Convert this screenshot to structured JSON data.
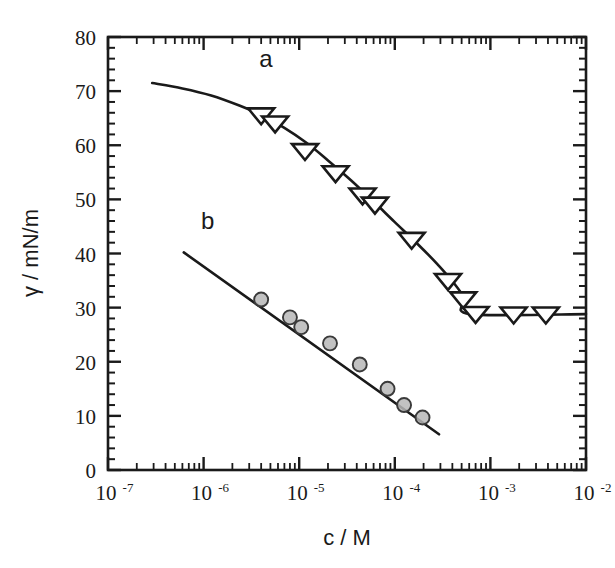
{
  "chart_data": {
    "type": "line",
    "title": "",
    "xlabel": "c / M",
    "ylabel": "γ / mN/m",
    "xscale": "log",
    "yscale": "linear",
    "xlim": [
      1e-07,
      0.01
    ],
    "ylim": [
      0,
      80
    ],
    "grid": false,
    "legend_position": "inline-annotation",
    "x_tick_labels": [
      "10-7",
      "10-6",
      "10-5",
      "10-4",
      "10-3",
      "10-2"
    ],
    "x_tick_mantissa": "10",
    "x_tick_exponents": [
      "-7",
      "-6",
      "-5",
      "-4",
      "-3",
      "-2"
    ],
    "x_tick_values": [
      1e-07,
      1e-06,
      1e-05,
      0.0001,
      0.001,
      0.01
    ],
    "y_tick_labels": [
      "0",
      "10",
      "20",
      "30",
      "40",
      "50",
      "60",
      "70",
      "80"
    ],
    "y_tick_values": [
      0,
      10,
      20,
      30,
      40,
      50,
      60,
      70,
      80
    ],
    "y_minor_step": 2,
    "annotations": [
      {
        "text": "a",
        "x": 4.5e-06,
        "y": 74.5
      },
      {
        "text": "b",
        "x": 1.1e-06,
        "y": 44.5
      }
    ],
    "series": [
      {
        "name": "a",
        "label": "a",
        "marker": "triangle-down",
        "marker_fill": "#ffffff",
        "marker_edge": "#1a1a1a",
        "marker_size": 13,
        "line_color": "#1a1a1a",
        "cmc": 0.00062,
        "plateau_value": 28.8,
        "points": [
          {
            "x": 4e-06,
            "y": 65.6
          },
          {
            "x": 5.6e-06,
            "y": 64.1
          },
          {
            "x": 1.15e-05,
            "y": 59.0
          },
          {
            "x": 2.4e-05,
            "y": 54.9
          },
          {
            "x": 4.6e-05,
            "y": 50.8
          },
          {
            "x": 6.2e-05,
            "y": 49.1
          },
          {
            "x": 0.00015,
            "y": 42.6
          },
          {
            "x": 0.00036,
            "y": 35.0
          },
          {
            "x": 0.00052,
            "y": 31.6
          },
          {
            "x": 0.0007,
            "y": 28.9
          },
          {
            "x": 0.00175,
            "y": 28.8
          },
          {
            "x": 0.0038,
            "y": 28.8
          }
        ],
        "curve": [
          {
            "x": 2.9e-07,
            "y": 71.5
          },
          {
            "x": 6e-07,
            "y": 70.5
          },
          {
            "x": 1.2e-06,
            "y": 69.2
          },
          {
            "x": 2.4e-06,
            "y": 67.3
          },
          {
            "x": 4e-06,
            "y": 65.6
          },
          {
            "x": 7e-06,
            "y": 63.2
          },
          {
            "x": 1.2e-05,
            "y": 60.4
          },
          {
            "x": 2e-05,
            "y": 57.2
          },
          {
            "x": 3.5e-05,
            "y": 53.5
          },
          {
            "x": 6e-05,
            "y": 49.6
          },
          {
            "x": 0.0001,
            "y": 45.8
          },
          {
            "x": 0.00017,
            "y": 41.9
          },
          {
            "x": 0.00028,
            "y": 38.0
          },
          {
            "x": 0.00042,
            "y": 34.4
          },
          {
            "x": 0.00054,
            "y": 31.6
          },
          {
            "x": 0.00062,
            "y": 28.8
          },
          {
            "x": 0.01,
            "y": 28.8
          }
        ]
      },
      {
        "name": "b",
        "label": "b",
        "marker": "circle",
        "marker_fill": "#b7b7b7",
        "marker_edge": "#3a3a3a",
        "marker_size": 14,
        "line_color": "#1a1a1a",
        "points": [
          {
            "x": 4e-06,
            "y": 31.5
          },
          {
            "x": 8e-06,
            "y": 28.2
          },
          {
            "x": 1.05e-05,
            "y": 26.4
          },
          {
            "x": 2.1e-05,
            "y": 23.4
          },
          {
            "x": 4.3e-05,
            "y": 19.5
          },
          {
            "x": 8.4e-05,
            "y": 15.0
          },
          {
            "x": 0.000125,
            "y": 12.0
          },
          {
            "x": 0.000195,
            "y": 9.7
          }
        ],
        "curve": [
          {
            "x": 6.2e-07,
            "y": 40.2
          },
          {
            "x": 0.00029,
            "y": 6.6
          }
        ]
      }
    ]
  },
  "axes": {
    "x_axis_name": "concentration-axis",
    "y_axis_name": "surface-tension-axis"
  }
}
